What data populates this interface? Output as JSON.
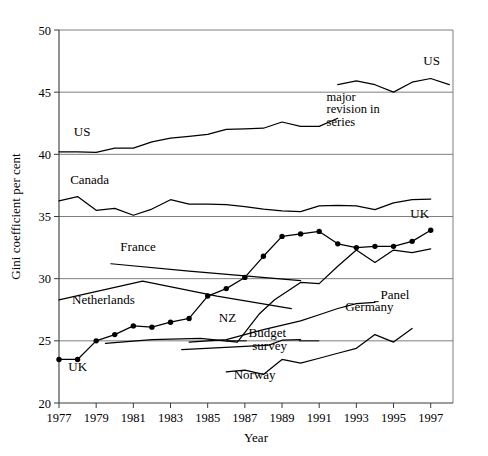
{
  "chart_data": {
    "type": "line",
    "title": "",
    "xlabel": "Year",
    "ylabel": "Gini coefficient per cent",
    "xlim": [
      1977,
      1998.2
    ],
    "ylim": [
      20,
      50
    ],
    "grid": true,
    "gridlines_y": [
      25,
      30,
      35,
      40,
      45
    ],
    "legend": "inline-labels",
    "xticks": [
      1977,
      1979,
      1981,
      1983,
      1985,
      1987,
      1989,
      1991,
      1993,
      1995,
      1997
    ],
    "xtick_labels": [
      "1977",
      "1979",
      "1981",
      "1983",
      "1985",
      "1987",
      "1989",
      "1991",
      "1993",
      "1995",
      "1997"
    ],
    "yticks": [
      20,
      25,
      30,
      35,
      40,
      45,
      50
    ],
    "ytick_labels": [
      "20",
      "25",
      "30",
      "35",
      "40",
      "45",
      "50"
    ],
    "annotations": [
      {
        "text": "major",
        "x": 1991.4,
        "y": 44.3
      },
      {
        "text": "revision in",
        "x": 1991.4,
        "y": 43.3
      },
      {
        "text": "series",
        "x": 1991.4,
        "y": 42.3
      }
    ],
    "series": [
      {
        "name": "US",
        "label": "US",
        "label_x": 1977.8,
        "label_y": 41.5,
        "markers": false,
        "x": [
          1977,
          1978,
          1979,
          1980,
          1981,
          1982,
          1983,
          1984,
          1985,
          1986,
          1987,
          1988,
          1989,
          1990,
          1991,
          1992
        ],
        "values": [
          40.2,
          40.2,
          40.15,
          40.5,
          40.5,
          41.0,
          41.3,
          41.45,
          41.6,
          42.0,
          42.05,
          42.1,
          42.6,
          42.25,
          42.25,
          42.9
        ]
      },
      {
        "name": "US revised",
        "label": "US",
        "label_x": 1996.6,
        "label_y": 47.2,
        "markers": false,
        "x": [
          1992,
          1993,
          1994,
          1995,
          1996,
          1997,
          1998
        ],
        "values": [
          45.6,
          45.9,
          45.6,
          45.0,
          45.8,
          46.1,
          45.6
        ]
      },
      {
        "name": "Canada",
        "label": "Canada",
        "label_x": 1977.6,
        "label_y": 37.6,
        "markers": false,
        "x": [
          1977,
          1978,
          1979,
          1980,
          1981,
          1982,
          1983,
          1984,
          1985,
          1986,
          1987,
          1988,
          1989,
          1990,
          1991,
          1992,
          1993,
          1994,
          1995,
          1996,
          1997
        ],
        "values": [
          36.25,
          36.6,
          35.5,
          35.65,
          35.1,
          35.6,
          36.35,
          36.0,
          36.0,
          35.95,
          35.8,
          35.6,
          35.45,
          35.4,
          35.85,
          35.9,
          35.85,
          35.55,
          36.1,
          36.35,
          36.4
        ]
      },
      {
        "name": "UK",
        "label": "UK",
        "label_x": 1977.5,
        "label_y": 22.6,
        "label2": "UK",
        "label2_x": 1995.9,
        "label2_y": 34.9,
        "markers": true,
        "x": [
          1977,
          1978,
          1979,
          1980,
          1981,
          1982,
          1983,
          1984,
          1985,
          1986,
          1987,
          1988,
          1989,
          1990,
          1991,
          1992,
          1993,
          1994,
          1995,
          1996,
          1997
        ],
        "values": [
          23.5,
          23.5,
          25.0,
          25.5,
          26.2,
          26.1,
          26.5,
          26.8,
          28.6,
          29.2,
          30.1,
          31.8,
          33.4,
          33.6,
          33.8,
          32.8,
          32.5,
          32.6,
          32.6,
          33.0,
          33.9
        ]
      },
      {
        "name": "France",
        "label": "France",
        "label_x": 1980.3,
        "label_y": 32.2,
        "markers": false,
        "x": [
          1979.8,
          1984,
          1990
        ],
        "values": [
          31.2,
          30.6,
          29.85
        ]
      },
      {
        "name": "Netherlands",
        "label": "Netherlands",
        "label_x": 1977.7,
        "label_y": 28.0,
        "markers": false,
        "x": [
          1977,
          1981.5,
          1985.5,
          1989.5
        ],
        "values": [
          28.3,
          29.8,
          28.6,
          27.6
        ]
      },
      {
        "name": "NZ",
        "label": "NZ",
        "label_x": 1985.6,
        "label_y": 26.5,
        "markers": false,
        "x": [
          1979.5,
          1982,
          1984.6,
          1986.6,
          1987.8,
          1988.6,
          1990,
          1991,
          1992,
          1993,
          1994,
          1995,
          1996,
          1997
        ],
        "values": [
          24.8,
          25.1,
          25.2,
          24.9,
          27.2,
          28.3,
          29.7,
          29.6,
          31.0,
          32.3,
          31.3,
          32.3,
          32.1,
          32.4
        ]
      },
      {
        "name": "Germany Panel",
        "label": "Panel",
        "label_x": 1994.3,
        "label_y": 28.4,
        "markers": false,
        "x": [
          1984,
          1986,
          1988,
          1990,
          1991,
          1992,
          1993,
          1994
        ],
        "values": [
          24.9,
          25.1,
          25.9,
          26.6,
          27.1,
          27.6,
          28.0,
          28.1
        ]
      },
      {
        "name": "Germany Budget survey",
        "label": "Germany",
        "label_x": 1992.4,
        "label_y": 27.4,
        "label2": "Budget",
        "label2_x": 1987.2,
        "label2_y": 25.3,
        "label3": "survey",
        "label3_x": 1987.4,
        "label3_y": 24.3,
        "markers": false,
        "x": [
          1983.6,
          1988.3,
          1989,
          1990
        ],
        "values": [
          24.3,
          24.65,
          25.05,
          25.1
        ]
      },
      {
        "name": "Norway",
        "label": "Norway",
        "label_x": 1986.4,
        "label_y": 21.9,
        "markers": false,
        "x": [
          1986,
          1987,
          1988,
          1989,
          1990,
          1991,
          1992,
          1993,
          1994,
          1995,
          1996
        ],
        "values": [
          22.5,
          22.65,
          22.3,
          23.5,
          23.2,
          23.6,
          24.0,
          24.4,
          25.5,
          24.9,
          26.0
        ]
      }
    ]
  }
}
